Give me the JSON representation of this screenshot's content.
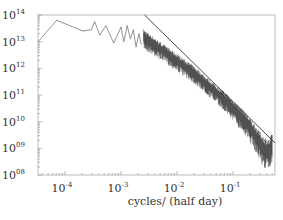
{
  "chart_data": {
    "type": "line",
    "title": "",
    "xlabel": "cycles/ (half day)",
    "ylabel": "",
    "xscale": "log",
    "yscale": "log",
    "xlim": [
      3.3e-05,
      0.56
    ],
    "ylim": [
      100000000.0,
      100000000000000.0
    ],
    "grid": false,
    "legend": null,
    "x_ticks": [
      {
        "value": 0.0001,
        "base": "10",
        "exp": "-4"
      },
      {
        "value": 0.001,
        "base": "10",
        "exp": "-3"
      },
      {
        "value": 0.01,
        "base": "10",
        "exp": "-2"
      },
      {
        "value": 0.1,
        "base": "10",
        "exp": "-1"
      }
    ],
    "y_ticks": [
      {
        "value": 100000000000000.0,
        "base": "10",
        "exp": "14"
      },
      {
        "value": 10000000000000.0,
        "base": "10",
        "exp": "13"
      },
      {
        "value": 1000000000000.0,
        "base": "10",
        "exp": "12"
      },
      {
        "value": 100000000000.0,
        "base": "10",
        "exp": "11"
      },
      {
        "value": 10000000000.0,
        "base": "10",
        "exp": "10"
      },
      {
        "value": 1000000000.0,
        "base": "10",
        "exp": "09"
      },
      {
        "value": 100000000.0,
        "base": "10",
        "exp": "08"
      }
    ],
    "series": [
      {
        "name": "power spectrum",
        "color": "#777777",
        "log_x": [
          -4.48,
          -4.15,
          -3.68,
          -3.53,
          -3.47,
          -3.38,
          -3.27,
          -3.13,
          -3.0,
          -2.95,
          -2.89,
          -2.83,
          -2.78,
          -2.73,
          -2.68,
          -2.64
        ],
        "log_y": [
          13.0,
          13.8,
          13.4,
          13.45,
          13.75,
          13.25,
          13.6,
          12.95,
          13.55,
          13.0,
          13.6,
          13.1,
          13.45,
          12.8,
          13.3,
          12.9
        ]
      },
      {
        "name": "power spectrum (dense band)",
        "color": "#111111",
        "band_log_x": [
          -2.6,
          -2.3,
          -2.0,
          -1.7,
          -1.4,
          -1.1,
          -0.8,
          -0.6,
          -0.45,
          -0.35,
          -0.3
        ],
        "band_center_log_y": [
          13.2,
          12.75,
          12.3,
          11.85,
          11.3,
          10.75,
          10.1,
          9.5,
          9.0,
          8.9,
          9.2
        ],
        "band_halfwidth_decades": [
          0.35,
          0.3,
          0.3,
          0.3,
          0.3,
          0.35,
          0.4,
          0.45,
          0.55,
          0.55,
          0.5
        ]
      },
      {
        "name": "power-law fit",
        "color": "#333333",
        "log_x": [
          -2.58,
          -0.25
        ],
        "log_y": [
          14.0,
          9.2
        ],
        "slope": -2.06
      }
    ]
  }
}
